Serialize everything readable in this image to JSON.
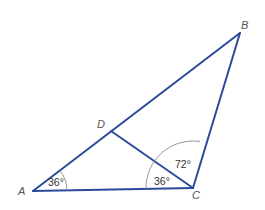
{
  "diagram": {
    "type": "triangle-geometry",
    "vertices": {
      "A": {
        "label": "A",
        "x": 33,
        "y": 191
      },
      "B": {
        "label": "B",
        "x": 240,
        "y": 33
      },
      "C": {
        "label": "C",
        "x": 193,
        "y": 188
      },
      "D": {
        "label": "D",
        "x": 111,
        "y": 131
      }
    },
    "segments": [
      "AB",
      "BC",
      "CA",
      "DC"
    ],
    "angles": {
      "A": {
        "label": "36°",
        "vertex": "A"
      },
      "ACD": {
        "label": "36°",
        "vertex": "C"
      },
      "DCB": {
        "label": "72°",
        "vertex": "C"
      }
    },
    "colors": {
      "edge": "#2b4a9a",
      "arc": "#8a8a8a",
      "label": "#555555"
    }
  }
}
